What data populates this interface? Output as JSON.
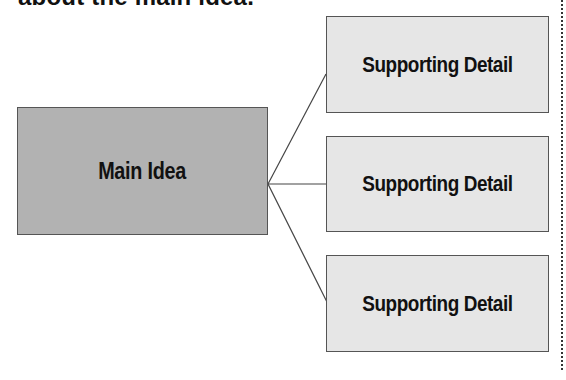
{
  "heading": {
    "text": "about the main idea."
  },
  "diagram": {
    "main_idea": {
      "label": "Main Idea",
      "fill": "#b2b2b2"
    },
    "supporting_details": [
      {
        "label": "Supporting Detail",
        "fill": "#e6e6e6"
      },
      {
        "label": "Supporting Detail",
        "fill": "#e6e6e6"
      },
      {
        "label": "Supporting Detail",
        "fill": "#e6e6e6"
      }
    ],
    "connector_color": "#444444",
    "divider_style": "dotted"
  }
}
